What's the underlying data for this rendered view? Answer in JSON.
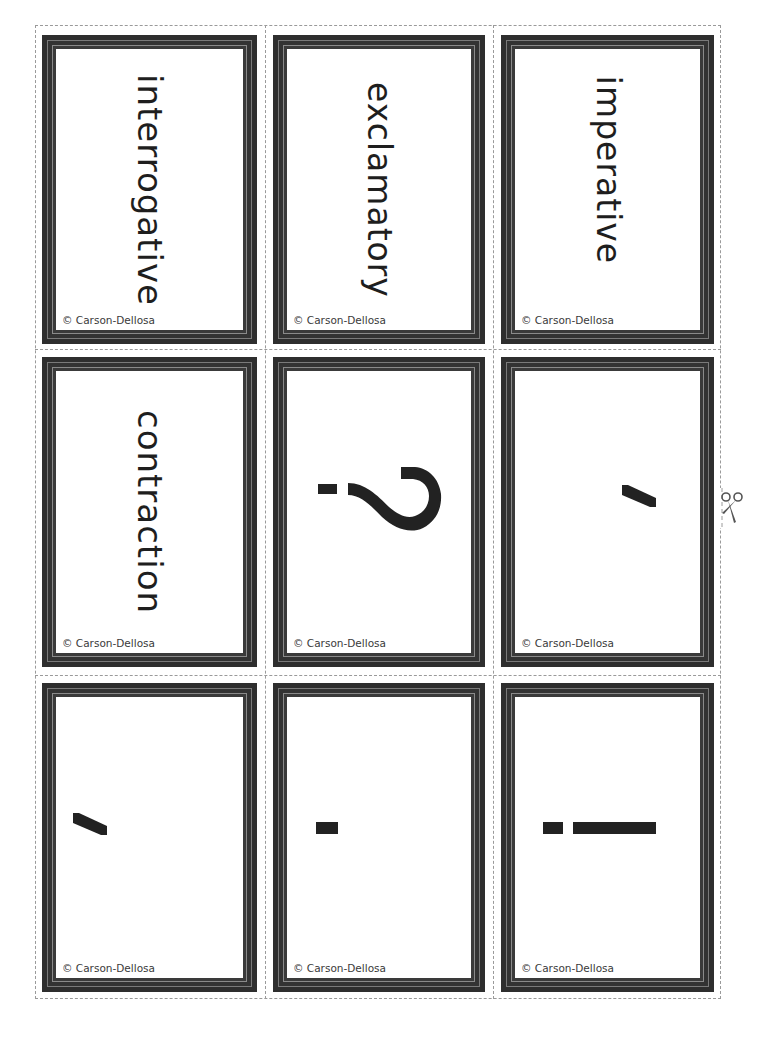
{
  "sheet": {
    "title": "Punctuation & Sentence Type Cards",
    "columns": 3,
    "rows": 3,
    "cut_icon": "scissors-icon",
    "colors": {
      "frame": "#2e2e2e",
      "frame_highlight": "#8a8a8a",
      "face": "#ffffff",
      "text": "#1e1e1e",
      "cutline": "#9a9a9a"
    }
  },
  "cards": [
    {
      "type": "word",
      "text": "interrogative",
      "copyright": "© Carson-Dellosa"
    },
    {
      "type": "word",
      "text": "exclamatory",
      "copyright": "© Carson-Dellosa"
    },
    {
      "type": "word",
      "text": "imperative",
      "copyright": "© Carson-Dellosa"
    },
    {
      "type": "word",
      "text": "contraction",
      "copyright": "© Carson-Dellosa"
    },
    {
      "type": "symbol",
      "symbol": "question-mark",
      "text": "?",
      "copyright": "© Carson-Dellosa"
    },
    {
      "type": "symbol",
      "symbol": "apostrophe",
      "text": "'",
      "copyright": "© Carson-Dellosa"
    },
    {
      "type": "symbol",
      "symbol": "comma",
      "text": ",",
      "copyright": "© Carson-Dellosa"
    },
    {
      "type": "symbol",
      "symbol": "period",
      "text": ".",
      "copyright": "© Carson-Dellosa"
    },
    {
      "type": "symbol",
      "symbol": "exclamation-mark",
      "text": "!",
      "copyright": "© Carson-Dellosa"
    }
  ]
}
